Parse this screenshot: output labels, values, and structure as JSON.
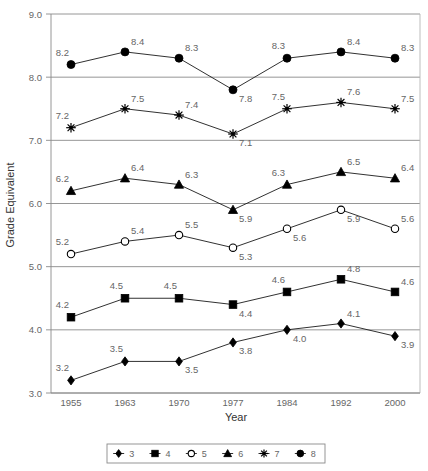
{
  "chart_data": {
    "type": "line",
    "title": "",
    "xlabel": "Year",
    "ylabel": "Grade Equivalent",
    "categories": [
      "1955",
      "1963",
      "1970",
      "1977",
      "1984",
      "1992",
      "2000"
    ],
    "x": [
      1955,
      1963,
      1970,
      1977,
      1984,
      1992,
      2000
    ],
    "ylim": [
      3.0,
      9.0
    ],
    "ytick_labels": [
      "3.0",
      "4.0",
      "5.0",
      "6.0",
      "7.0",
      "8.0",
      "9.0"
    ],
    "ytick_values": [
      3.0,
      4.0,
      5.0,
      6.0,
      7.0,
      8.0,
      9.0
    ],
    "grid": true,
    "legend_position": "bottom",
    "series": [
      {
        "name": "3",
        "marker": "diamond",
        "values": [
          3.2,
          3.5,
          3.5,
          3.8,
          4.0,
          4.1,
          3.9
        ],
        "labels": [
          "3.2",
          "3.5",
          "3.5",
          "3.8",
          "4.0",
          "4.1",
          "3.9"
        ],
        "label_pos": [
          "above-left",
          "above-left",
          "below-right",
          "below-right",
          "below-right",
          "above-right",
          "below-right"
        ]
      },
      {
        "name": "4",
        "marker": "square",
        "values": [
          4.2,
          4.5,
          4.5,
          4.4,
          4.6,
          4.8,
          4.6
        ],
        "labels": [
          "4.2",
          "4.5",
          "4.5",
          "4.4",
          "4.6",
          "4.8",
          "4.6"
        ],
        "label_pos": [
          "above-left",
          "above-left",
          "above-left",
          "below-right",
          "above-left",
          "above-right",
          "above-right"
        ]
      },
      {
        "name": "5",
        "marker": "circle-open",
        "values": [
          5.2,
          5.4,
          5.5,
          5.3,
          5.6,
          5.9,
          5.6
        ],
        "labels": [
          "5.2",
          "5.4",
          "5.5",
          "5.3",
          "5.6",
          "5.9",
          "5.6"
        ],
        "label_pos": [
          "above-left",
          "above-right",
          "above-right",
          "below-right",
          "below-right",
          "below-right",
          "above-right"
        ]
      },
      {
        "name": "6",
        "marker": "triangle",
        "values": [
          6.2,
          6.4,
          6.3,
          5.9,
          6.3,
          6.5,
          6.4
        ],
        "labels": [
          "6.2",
          "6.4",
          "6.3",
          "5.9",
          "6.3",
          "6.5",
          "6.4"
        ],
        "label_pos": [
          "above-left",
          "above-right",
          "above-right",
          "below-right",
          "above-left",
          "above-right",
          "above-right"
        ]
      },
      {
        "name": "7",
        "marker": "star",
        "values": [
          7.2,
          7.5,
          7.4,
          7.1,
          7.5,
          7.6,
          7.5
        ],
        "labels": [
          "7.2",
          "7.5",
          "7.4",
          "7.1",
          "7.5",
          "7.6",
          "7.5"
        ],
        "label_pos": [
          "above-left",
          "above-right",
          "above-right",
          "below-right",
          "above-left",
          "above-right",
          "above-right"
        ]
      },
      {
        "name": "8",
        "marker": "circle-filled",
        "values": [
          8.2,
          8.4,
          8.3,
          7.8,
          8.3,
          8.4,
          8.3
        ],
        "labels": [
          "8.2",
          "8.4",
          "8.3",
          "7.8",
          "8.3",
          "8.4",
          "8.3"
        ],
        "label_pos": [
          "above-left",
          "above-right",
          "above-right",
          "below-right",
          "above-left",
          "above-right",
          "above-right"
        ]
      }
    ],
    "legend_entries": [
      {
        "label": "3",
        "marker": "diamond"
      },
      {
        "label": "4",
        "marker": "square"
      },
      {
        "label": "5",
        "marker": "circle-open"
      },
      {
        "label": "6",
        "marker": "triangle"
      },
      {
        "label": "7",
        "marker": "star"
      },
      {
        "label": "8",
        "marker": "circle-filled"
      }
    ]
  },
  "colors": {
    "line": "#1a1a1a",
    "grid": "#8a8a8a",
    "text": "#666666",
    "background": "#ffffff"
  }
}
